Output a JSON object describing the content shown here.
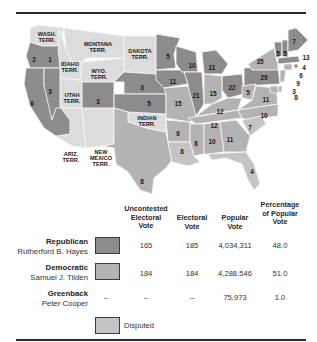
{
  "colors": {
    "republican": "#8c8c8c",
    "democratic": "#b3b3b3",
    "disputed": "#c4c4c4",
    "territory": "#dcdcdc",
    "border": "#f5f5f5",
    "rule": "#2a2a2a"
  },
  "map": {
    "territories": [
      {
        "name": "WASH. TERR.",
        "lines": [
          "WASH.",
          "TERR."
        ]
      },
      {
        "name": "MONTANA TERR.",
        "lines": [
          "MONTANA",
          "TERR."
        ]
      },
      {
        "name": "DAKOTA TERR.",
        "lines": [
          "DAKOTA",
          "TERR."
        ]
      },
      {
        "name": "IDAHO TERR.",
        "lines": [
          "IDAHO",
          "TERR."
        ]
      },
      {
        "name": "WYO. TERR.",
        "lines": [
          "WYO.",
          "TERR."
        ]
      },
      {
        "name": "UTAH TERR.",
        "lines": [
          "UTAH",
          "TERR."
        ]
      },
      {
        "name": "ARIZ. TERR.",
        "lines": [
          "ARIZ.",
          "TERR."
        ]
      },
      {
        "name": "NEW MEXICO TERR.",
        "lines": [
          "NEW",
          "MEXICO",
          "TERR."
        ]
      },
      {
        "name": "INDIAN TERR.",
        "lines": [
          "INDIAN",
          "TERR."
        ]
      }
    ],
    "state_votes": [
      {
        "state": "Oregon",
        "votes": "2"
      },
      {
        "state": "Oregon (disputed elector)",
        "votes": "1"
      },
      {
        "state": "California",
        "votes": "6"
      },
      {
        "state": "Nevada",
        "votes": "3"
      },
      {
        "state": "Colorado",
        "votes": "3"
      },
      {
        "state": "Nebraska",
        "votes": "3"
      },
      {
        "state": "Kansas",
        "votes": "5"
      },
      {
        "state": "Texas",
        "votes": "8"
      },
      {
        "state": "Minnesota",
        "votes": "5"
      },
      {
        "state": "Iowa",
        "votes": "11"
      },
      {
        "state": "Missouri",
        "votes": "15"
      },
      {
        "state": "Arkansas",
        "votes": "6"
      },
      {
        "state": "Louisiana",
        "votes": "8"
      },
      {
        "state": "Wisconsin",
        "votes": "10"
      },
      {
        "state": "Illinois",
        "votes": "21"
      },
      {
        "state": "Michigan",
        "votes": "11"
      },
      {
        "state": "Indiana",
        "votes": "15"
      },
      {
        "state": "Ohio",
        "votes": "22"
      },
      {
        "state": "Kentucky",
        "votes": "12"
      },
      {
        "state": "Tennessee",
        "votes": "12"
      },
      {
        "state": "Mississippi",
        "votes": "8"
      },
      {
        "state": "Alabama",
        "votes": "10"
      },
      {
        "state": "Georgia",
        "votes": "11"
      },
      {
        "state": "Florida",
        "votes": "4"
      },
      {
        "state": "South Carolina",
        "votes": "7"
      },
      {
        "state": "North Carolina",
        "votes": "10"
      },
      {
        "state": "Virginia",
        "votes": "11"
      },
      {
        "state": "West Virginia",
        "votes": "5"
      },
      {
        "state": "Pennsylvania",
        "votes": "29"
      },
      {
        "state": "New York",
        "votes": "35"
      },
      {
        "state": "Vermont",
        "votes": "5"
      },
      {
        "state": "New Hampshire",
        "votes": "5"
      },
      {
        "state": "Maine",
        "votes": "7"
      },
      {
        "state": "Massachusetts",
        "votes": "13"
      },
      {
        "state": "Rhode Island",
        "votes": "4"
      },
      {
        "state": "Connecticut",
        "votes": "6"
      },
      {
        "state": "New Jersey",
        "votes": "9"
      },
      {
        "state": "Delaware",
        "votes": "3"
      },
      {
        "state": "Maryland",
        "votes": "8"
      }
    ]
  },
  "table": {
    "headers": {
      "uncontested": [
        "Uncontested",
        "Electoral",
        "Vote"
      ],
      "electoral": [
        "Electoral",
        "Vote"
      ],
      "popular": [
        "Popular",
        "Vote"
      ],
      "percentage": [
        "Percentage",
        "of Popular",
        "Vote"
      ]
    },
    "rows": [
      {
        "party": "Republican",
        "candidate": "Rutherford B. Hayes",
        "uncontested": "165",
        "electoral": "185",
        "popular": "4,034,311",
        "percentage": "48.0",
        "swatch": "republican"
      },
      {
        "party": "Democratic",
        "candidate": "Samuel J. Tilden",
        "uncontested": "184",
        "electoral": "184",
        "popular": "4,288,546",
        "percentage": "51.0",
        "swatch": "democratic"
      },
      {
        "party": "Greenback",
        "candidate": "Peter Cooper",
        "uncontested": "–",
        "electoral": "–",
        "popular": "75,973",
        "percentage": "1.0",
        "swatch": null
      }
    ],
    "legend": {
      "label": "Disputed"
    }
  }
}
